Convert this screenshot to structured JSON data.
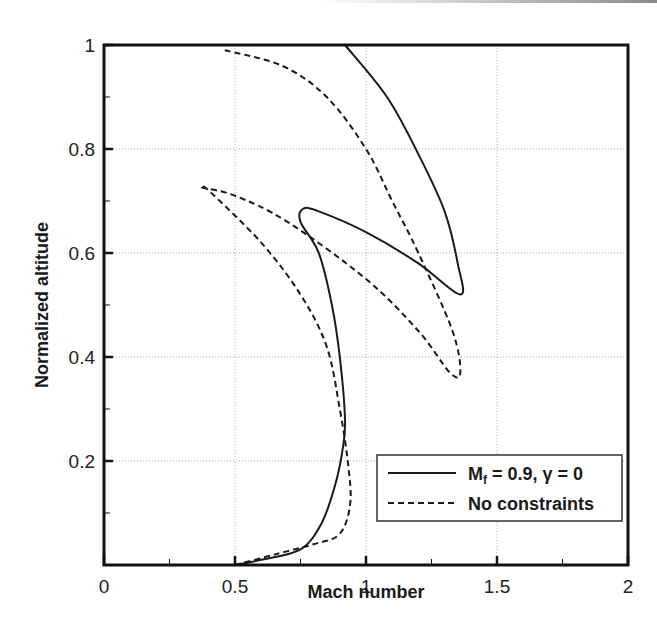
{
  "chart_data": {
    "type": "line",
    "title": "",
    "xlabel": "Mach number",
    "ylabel": "Normalized altitude",
    "xlim": [
      0,
      2
    ],
    "ylim": [
      0,
      1
    ],
    "x_ticks": [
      0,
      0.5,
      1,
      1.5,
      2
    ],
    "x_tick_labels": [
      "0",
      "0.5",
      "1",
      "1.5",
      "2"
    ],
    "y_ticks": [
      0.2,
      0.4,
      0.6,
      0.8,
      1
    ],
    "y_tick_labels": [
      "0.2",
      "0.4",
      "0.6",
      "0.8",
      "1"
    ],
    "grid": true,
    "legend_position": "lower right",
    "series": [
      {
        "name": "Mf = 0.9, γ = 0",
        "legend_main": "M",
        "legend_sub": "f",
        "legend_rest": " = 0.9, γ = 0",
        "style": "solid",
        "color": "#1a1a1a",
        "points": [
          [
            0.5,
            0.0
          ],
          [
            0.6,
            0.01
          ],
          [
            0.75,
            0.03
          ],
          [
            0.83,
            0.08
          ],
          [
            0.88,
            0.15
          ],
          [
            0.91,
            0.22
          ],
          [
            0.92,
            0.28
          ],
          [
            0.9,
            0.4
          ],
          [
            0.87,
            0.5
          ],
          [
            0.82,
            0.6
          ],
          [
            0.75,
            0.66
          ],
          [
            0.76,
            0.685
          ],
          [
            0.82,
            0.68
          ],
          [
            1.0,
            0.64
          ],
          [
            1.2,
            0.58
          ],
          [
            1.36,
            0.52
          ],
          [
            1.35,
            0.58
          ],
          [
            1.3,
            0.68
          ],
          [
            1.2,
            0.79
          ],
          [
            1.08,
            0.9
          ],
          [
            0.92,
            1.0
          ]
        ]
      },
      {
        "name": "No constraints",
        "legend_main": "No constraints",
        "style": "dashed",
        "color": "#1a1a1a",
        "points": [
          [
            0.5,
            0.0
          ],
          [
            0.65,
            0.02
          ],
          [
            0.8,
            0.04
          ],
          [
            0.9,
            0.06
          ],
          [
            0.94,
            0.12
          ],
          [
            0.93,
            0.2
          ],
          [
            0.9,
            0.3
          ],
          [
            0.85,
            0.42
          ],
          [
            0.75,
            0.52
          ],
          [
            0.6,
            0.62
          ],
          [
            0.4,
            0.72
          ],
          [
            0.38,
            0.725
          ],
          [
            0.5,
            0.71
          ],
          [
            0.7,
            0.66
          ],
          [
            1.0,
            0.55
          ],
          [
            1.2,
            0.45
          ],
          [
            1.32,
            0.37
          ],
          [
            1.36,
            0.37
          ],
          [
            1.33,
            0.45
          ],
          [
            1.2,
            0.6
          ],
          [
            1.1,
            0.7
          ],
          [
            1.0,
            0.8
          ],
          [
            0.85,
            0.9
          ],
          [
            0.68,
            0.96
          ],
          [
            0.46,
            0.99
          ]
        ]
      }
    ]
  }
}
